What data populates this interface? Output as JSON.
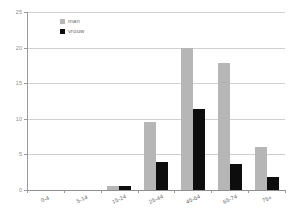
{
  "chart_data": {
    "type": "bar",
    "title": "",
    "xlabel": "",
    "ylabel": "",
    "ylim": [
      0,
      25
    ],
    "yticks": [
      0,
      5,
      10,
      15,
      20,
      25
    ],
    "grid": true,
    "legend_position": "top-left",
    "categories": [
      "0-4",
      "5-14",
      "15-24",
      "25-44",
      "45-64",
      "65-74",
      "75+"
    ],
    "series": [
      {
        "name": "man",
        "color": "#b6b6b6",
        "values": [
          0,
          0,
          0.6,
          9.6,
          19.9,
          17.9,
          6.0
        ]
      },
      {
        "name": "vrouw",
        "color": "#0d0d0d",
        "values": [
          0,
          0,
          0.6,
          4.0,
          11.4,
          3.7,
          1.8
        ]
      }
    ]
  },
  "legend": {
    "items": [
      {
        "label": "man",
        "color": "#b6b6b6"
      },
      {
        "label": "vrouw",
        "color": "#0d0d0d"
      }
    ]
  },
  "axes": {
    "y": {
      "tick_labels": [
        "25",
        "20",
        "15",
        "10",
        "5",
        "0"
      ],
      "min": 0,
      "max": 25
    },
    "x": {
      "tick_labels": [
        "0-4",
        "5-14",
        "15-24",
        "25-44",
        "45-64",
        "65-74",
        "75+"
      ]
    }
  },
  "colors": {
    "series_man": "#b6b6b6",
    "series_vrouw": "#0d0d0d",
    "gridline": "#d0d0d0",
    "axis": "#9a9a9a",
    "tick_text": "#8a8a8a",
    "background": "#ffffff"
  }
}
